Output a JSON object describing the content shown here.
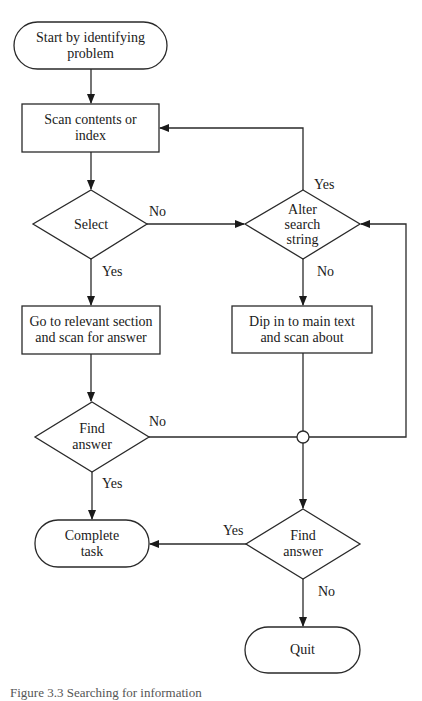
{
  "nodes": {
    "start": {
      "type": "terminal",
      "text": "Start by identifying problem",
      "lines": [
        "Start by identifying",
        "problem"
      ]
    },
    "scan": {
      "type": "process",
      "text": "Scan contents or index",
      "lines": [
        "Scan contents or",
        "index"
      ]
    },
    "select": {
      "type": "decision",
      "text": "Select",
      "lines": [
        "Select"
      ]
    },
    "alter": {
      "type": "decision",
      "text": "Alter search string",
      "lines": [
        "Alter",
        "search",
        "string"
      ]
    },
    "goto": {
      "type": "process",
      "text": "Go to relevant section and scan for answer",
      "lines": [
        "Go to relevant section",
        "and scan for answer"
      ]
    },
    "dip": {
      "type": "process",
      "text": "Dip in to main text and scan about",
      "lines": [
        "Dip in to main text",
        "and scan about"
      ]
    },
    "find1": {
      "type": "decision",
      "text": "Find answer",
      "lines": [
        "Find",
        "answer"
      ]
    },
    "find2": {
      "type": "decision",
      "text": "Find answer",
      "lines": [
        "Find",
        "answer"
      ]
    },
    "complete": {
      "type": "terminal",
      "text": "Complete task",
      "lines": [
        "Complete",
        "task"
      ]
    },
    "quit": {
      "type": "terminal",
      "text": "Quit",
      "lines": [
        "Quit"
      ]
    }
  },
  "edges": [
    {
      "from": "start",
      "to": "scan",
      "label": ""
    },
    {
      "from": "scan",
      "to": "select",
      "label": ""
    },
    {
      "from": "select",
      "to": "alter",
      "label": "No"
    },
    {
      "from": "select",
      "to": "goto",
      "label": "Yes"
    },
    {
      "from": "alter",
      "to": "scan",
      "label": "Yes"
    },
    {
      "from": "alter",
      "to": "dip",
      "label": "No"
    },
    {
      "from": "goto",
      "to": "find1",
      "label": ""
    },
    {
      "from": "find1",
      "to": "complete",
      "label": "Yes"
    },
    {
      "from": "find1",
      "to": "junction",
      "label": "No"
    },
    {
      "from": "dip",
      "to": "junction",
      "label": ""
    },
    {
      "from": "junction",
      "to": "alter",
      "label": ""
    },
    {
      "from": "junction",
      "to": "find2",
      "label": ""
    },
    {
      "from": "find2",
      "to": "complete",
      "label": "Yes"
    },
    {
      "from": "find2",
      "to": "quit",
      "label": "No"
    }
  ],
  "edge_labels": {
    "yes": "Yes",
    "no": "No"
  },
  "caption": "Figure 3.3  Searching for information"
}
